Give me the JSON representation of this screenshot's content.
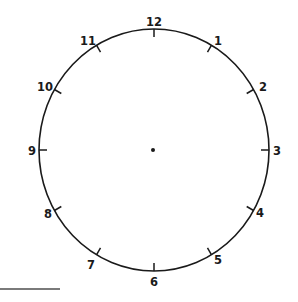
{
  "clock": {
    "title": "Blank clock face",
    "center": {
      "x": 154,
      "y": 150
    },
    "radius_x": 115,
    "radius_y": 121,
    "tick_length": 8,
    "stroke_color": "#1a1a1a",
    "center_dot": true,
    "hands": [],
    "numbers": [
      {
        "label": "12",
        "hour": 12
      },
      {
        "label": "1",
        "hour": 1
      },
      {
        "label": "2",
        "hour": 2
      },
      {
        "label": "3",
        "hour": 3
      },
      {
        "label": "4",
        "hour": 4
      },
      {
        "label": "5",
        "hour": 5
      },
      {
        "label": "6",
        "hour": 6
      },
      {
        "label": "7",
        "hour": 7
      },
      {
        "label": "8",
        "hour": 8
      },
      {
        "label": "9",
        "hour": 9
      },
      {
        "label": "10",
        "hour": 10
      },
      {
        "label": "11",
        "hour": 11
      }
    ]
  },
  "bottom_rule": {
    "color": "#7a7a7a"
  }
}
